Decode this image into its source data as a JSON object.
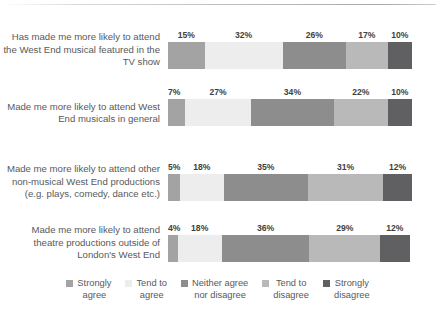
{
  "chart_data": {
    "type": "bar",
    "subtype": "100% stacked horizontal bar",
    "title": "",
    "xlabel": "",
    "ylabel": "",
    "xlim": [
      0,
      100
    ],
    "grid": false,
    "legend_position": "bottom",
    "categories": [
      "Has made me more likely to attend the West End musical featured in the TV show",
      "Made me more likely to attend West End musicals in general",
      "Made me more likely to attend other non-musical West End productions (e.g. plays, comedy, dance etc.)",
      "Made me more likely to attend theatre productions outside of London's West End"
    ],
    "series": [
      {
        "name": "Strongly agree",
        "color": "#a3a3a3",
        "values": [
          15,
          7,
          5,
          4
        ],
        "labels": [
          "15%",
          "7%",
          "5%",
          "4%"
        ]
      },
      {
        "name": "Tend to agree",
        "color": "#ededed",
        "values": [
          32,
          27,
          18,
          18
        ],
        "labels": [
          "32%",
          "27%",
          "18%",
          "18%"
        ]
      },
      {
        "name": "Neither agree nor disagree",
        "color": "#8d8d8d",
        "values": [
          26,
          34,
          35,
          36
        ],
        "labels": [
          "26%",
          "34%",
          "35%",
          "36%"
        ]
      },
      {
        "name": "Tend to disagree",
        "color": "#b9b9b9",
        "values": [
          17,
          22,
          31,
          29
        ],
        "labels": [
          "17%",
          "22%",
          "31%",
          "29%"
        ]
      },
      {
        "name": "Strongly disagree",
        "color": "#606062",
        "values": [
          10,
          10,
          12,
          12
        ],
        "labels": [
          "10%",
          "10%",
          "12%",
          "12%"
        ]
      }
    ]
  },
  "legend": {
    "items": [
      {
        "label": "Strongly\nagree",
        "color": "#a3a3a3"
      },
      {
        "label": "Tend to\nagree",
        "color": "#ededed"
      },
      {
        "label": "Neither agree\nnor disagree",
        "color": "#8d8d8d"
      },
      {
        "label": "Tend to\ndisagree",
        "color": "#b9b9b9"
      },
      {
        "label": "Strongly\ndisagree",
        "color": "#606062"
      }
    ]
  },
  "rows": [
    {
      "label": "Has made me more likely to\nattend the West End musical\nfeatured in the TV show",
      "top": 31
    },
    {
      "label": "Made me more likely to attend\nWest End musicals in general",
      "top": 99
    },
    {
      "label": "Made me more likely to attend\nother non-musical West End\nproductions (e.g. plays, comedy,\ndance etc.)",
      "top": 163
    },
    {
      "label": "Made me more likely to attend\ntheatre productions outside of\nLondon's West End",
      "top": 224
    }
  ]
}
